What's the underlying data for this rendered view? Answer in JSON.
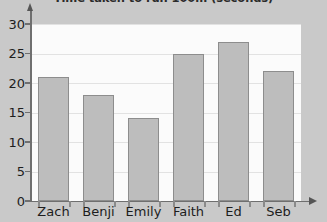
{
  "chart_data": {
    "type": "bar",
    "title": "Time taken to run 100m (seconds)",
    "xlabel": "",
    "ylabel": "",
    "categories": [
      "Zach",
      "Benji",
      "Emily",
      "Faith",
      "Ed",
      "Seb"
    ],
    "values": [
      21,
      18,
      14,
      25,
      27,
      22
    ],
    "ylim": [
      0,
      30
    ],
    "yticks": [
      0,
      5,
      10,
      15,
      20,
      25,
      30
    ],
    "ytick_labels": [
      "0",
      "5",
      "10",
      "15",
      "20",
      "25",
      "30"
    ],
    "grid": true,
    "legend": null,
    "colors": {
      "bar_fill": "#bdbdbd",
      "bar_stroke": "#8d8d8d",
      "plot_background": "#fbfbfb",
      "page_background": "#c9c9c9",
      "axis": "#6f6f6f",
      "gridline": "#e2e2e2",
      "text": "#1d1d1d"
    }
  }
}
